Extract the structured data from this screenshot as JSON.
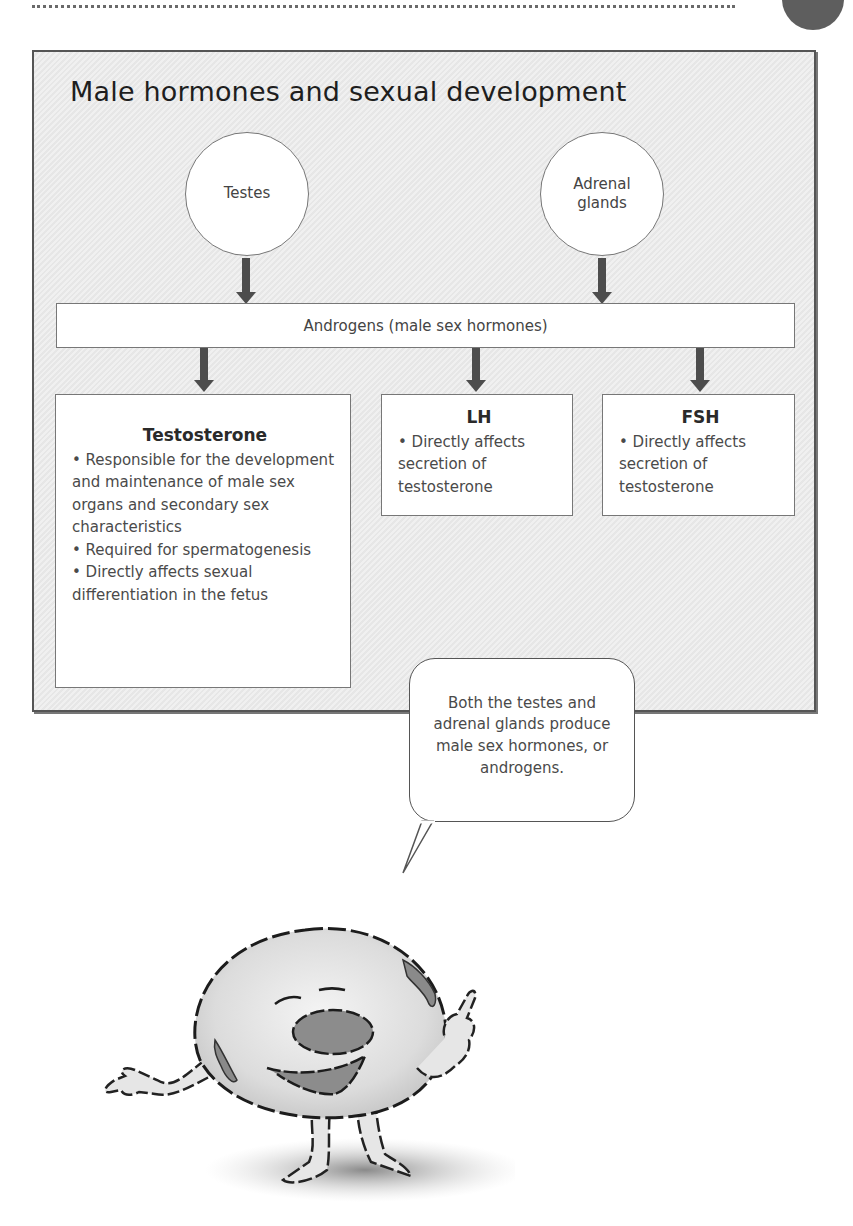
{
  "header": {
    "page_marker_color": "#5e5e5e"
  },
  "diagram": {
    "title": "Male hormones and sexual development",
    "sources": [
      {
        "label": "Testes"
      },
      {
        "label_line1": "Adrenal",
        "label_line2": "glands"
      }
    ],
    "androgens_bar": "Androgens (male sex hormones)",
    "hormones": [
      {
        "name": "Testosterone",
        "bullets": [
          "• Responsible for the development and maintenance of male sex organs and secondary sex characteristics",
          "• Required for spermatogenesis",
          "• Directly affects sexual differentiation in the fetus"
        ]
      },
      {
        "name": "LH",
        "bullets": [
          "• Directly affects secretion of testosterone"
        ]
      },
      {
        "name": "FSH",
        "bullets": [
          "• Directly affects secretion of testosterone"
        ]
      }
    ]
  },
  "callout": {
    "text": "Both the testes and adrenal glands produce male sex hormones, or androgens."
  },
  "mascot": {
    "description": "cartoon cell character pointing"
  },
  "colors": {
    "panel_bg": "#ebebeb",
    "border": "#555555",
    "arrow": "#4d4d4d",
    "cell_fill": "#e2e2e2",
    "cell_spot": "#8a8a8a"
  }
}
